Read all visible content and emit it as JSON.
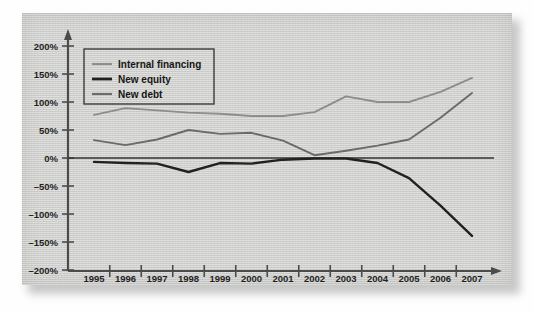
{
  "chart_data": {
    "type": "line",
    "title": "",
    "subtitle": "",
    "xlabel": "",
    "ylabel": "",
    "grid": false,
    "legend_position": "top-left",
    "x": [
      1995,
      1996,
      1997,
      1998,
      1999,
      2000,
      2001,
      2002,
      2003,
      2004,
      2005,
      2006,
      2007
    ],
    "categories": [
      "1995",
      "1996",
      "1997",
      "1998",
      "1999",
      "2000",
      "2001",
      "2002",
      "2003",
      "2004",
      "2005",
      "2006",
      "2007"
    ],
    "xtick_labels": [
      "1995",
      "1996",
      "1997",
      "1998",
      "1999",
      "2000",
      "2001",
      "2002",
      "2003",
      "2004",
      "2005",
      "2006",
      "2007"
    ],
    "ytick_labels": [
      "200%",
      "150%",
      "100%",
      "50%",
      "0%",
      "–50%",
      "–100%",
      "–150%",
      "–200%"
    ],
    "ytick_values": [
      200,
      150,
      100,
      50,
      0,
      -50,
      -100,
      -150,
      -200
    ],
    "ylim": [
      -200,
      200
    ],
    "xlim": [
      1995,
      2007
    ],
    "units": "percent",
    "series": [
      {
        "name": "Internal financing",
        "color": "#8d8d8d",
        "values": [
          77,
          89,
          85,
          81,
          79,
          75,
          75,
          82,
          110,
          100,
          100,
          118,
          143
        ]
      },
      {
        "name": "New equity",
        "color": "#1f1f1f",
        "values": [
          -7,
          -9,
          -10,
          -25,
          -9,
          -10,
          -3,
          -1,
          -1,
          -9,
          -36,
          -85,
          -139
        ]
      },
      {
        "name": "New debt",
        "color": "#6a6a6a",
        "values": [
          32,
          23,
          33,
          50,
          43,
          45,
          31,
          5,
          13,
          22,
          33,
          72,
          116
        ]
      }
    ]
  },
  "legend": {
    "items": [
      {
        "label": "Internal financing",
        "color": "#8d8d8d",
        "width": 2.0
      },
      {
        "label": "New equity",
        "color": "#1f1f1f",
        "width": 2.6
      },
      {
        "label": "New debt",
        "color": "#6a6a6a",
        "width": 2.0
      }
    ]
  },
  "axes": {
    "zero_line_color": "#303030",
    "axis_color": "#4a4a4a",
    "has_arrow_x": true,
    "has_arrow_y": true
  },
  "panel": {
    "background_color": "#d2d2d0",
    "page_background_color": "#fefefe"
  }
}
